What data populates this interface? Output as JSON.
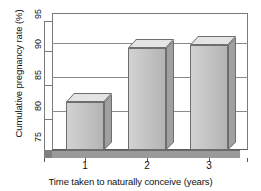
{
  "chart_data": {
    "type": "bar",
    "title": "",
    "subtitle": "",
    "xlabel": "Time taken to naturally conceive (years)",
    "ylabel": "Cumulative pregnancy rate (%)",
    "categories": [
      "1",
      "2",
      "3"
    ],
    "values": [
      83.3,
      91.2,
      91.7
    ],
    "ylim": [
      75,
      95
    ],
    "yticks": [
      75,
      80,
      85,
      90,
      95
    ],
    "ytick_labels": [
      "75",
      "80",
      "85",
      "90",
      "95"
    ],
    "xtick_labels": [
      "1",
      "2",
      "3"
    ],
    "grid": true,
    "legend": false,
    "legend_position": "none",
    "style": "3d-bar",
    "colors": {
      "bar_front": "#c6c6c6",
      "bar_top": "#e4e4e4",
      "bar_side": "#a0a0a0",
      "bar_outline": "#6e6e6e",
      "gridline": "#8a8a8a",
      "axis": "#5a5a5a",
      "floor": "#9a9a9a",
      "background": "#ffffff",
      "text": "#111111"
    },
    "annotations": []
  },
  "axes": {
    "y_title": "Cumulative pregnancy rate (%)",
    "x_title": "Time taken to naturally conceive (years)",
    "y_ticks": [
      {
        "label": "95",
        "value": 95
      },
      {
        "label": "90",
        "value": 90
      },
      {
        "label": "85",
        "value": 85
      },
      {
        "label": "80",
        "value": 80
      },
      {
        "label": "75",
        "value": 75
      }
    ],
    "x_ticks": [
      {
        "label": "1",
        "value": 1
      },
      {
        "label": "2",
        "value": 2
      },
      {
        "label": "3",
        "value": 3
      }
    ]
  },
  "bars": [
    {
      "category": "1",
      "value": 83.3,
      "label": ""
    },
    {
      "category": "2",
      "value": 91.2,
      "label": ""
    },
    {
      "category": "3",
      "value": 91.7,
      "label": ""
    }
  ]
}
